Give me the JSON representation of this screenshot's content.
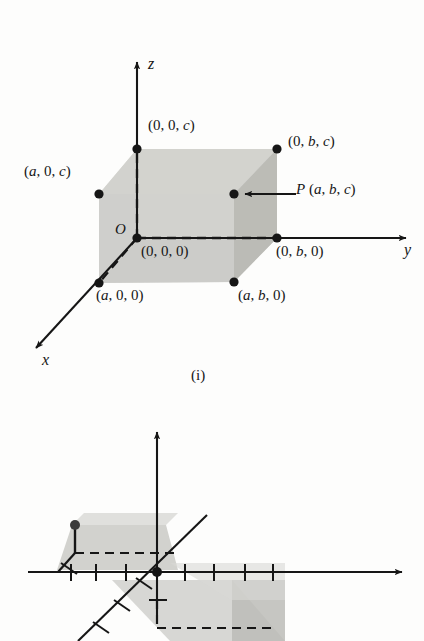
{
  "figure_one": {
    "caption": "(i)",
    "axes": {
      "x": "x",
      "y": "y",
      "z": "z"
    },
    "origin_label": "O",
    "vertices": [
      {
        "id": "origin",
        "label": "(0, 0, 0)"
      },
      {
        "id": "z-cap",
        "label": "(0, 0, c)"
      },
      {
        "id": "a0c",
        "label": "(a, 0, c)"
      },
      {
        "id": "0bc",
        "label": "(0, b, c)"
      },
      {
        "id": "P",
        "label": "P (a, b, c)"
      },
      {
        "id": "0b0",
        "label": "(0, b, 0)"
      },
      {
        "id": "a00",
        "label": "(a, 0, 0)"
      },
      {
        "id": "ab0",
        "label": "(a, b, 0)"
      }
    ],
    "colors": {
      "ink": "#161616",
      "box_fill": "#cfcfcb",
      "box_fill_light": "#dedeo"
    }
  },
  "figure_two": {
    "axes": {
      "y": "y",
      "z": "z"
    },
    "origin_label": "O",
    "point_label": "A (-1, -3, 1)",
    "tick_count_left": 3,
    "tick_count_right": 4,
    "tick_count_x_axis": 3
  },
  "chart_data": {
    "type": "scatter",
    "panels": [
      {
        "name": "(i)",
        "description": "Rectangular box in 3-space with one vertex at the origin and opposite vertex P(a, b, c)",
        "axis_labels": {
          "x": "x",
          "y": "y",
          "z": "z"
        },
        "points": [
          {
            "label": "(0, 0, 0)",
            "coords": [
              0,
              0,
              0
            ]
          },
          {
            "label": "(0, 0, c)",
            "coords": [
              0,
              0,
              "c"
            ]
          },
          {
            "label": "(a, 0, c)",
            "coords": [
              "a",
              0,
              "c"
            ]
          },
          {
            "label": "(0, b, c)",
            "coords": [
              0,
              "b",
              "c"
            ]
          },
          {
            "label": "P (a, b, c)",
            "coords": [
              "a",
              "b",
              "c"
            ]
          },
          {
            "label": "(0, b, 0)",
            "coords": [
              0,
              "b",
              0
            ]
          },
          {
            "label": "(a, 0, 0)",
            "coords": [
              "a",
              0,
              0
            ]
          },
          {
            "label": "(a, b, 0)",
            "coords": [
              "a",
              "b",
              0
            ]
          }
        ],
        "annotations": [
          "O"
        ]
      },
      {
        "name": "(ii)",
        "description": "Plot of the point A(-1, -3, 1) in 3-space with dashed projection lines",
        "axis_labels": {
          "y": "y",
          "z": "z"
        },
        "points": [
          {
            "label": "A (-1, -3, 1)",
            "coords": [
              -1,
              -3,
              1
            ]
          }
        ],
        "annotations": [
          "O"
        ]
      }
    ]
  }
}
